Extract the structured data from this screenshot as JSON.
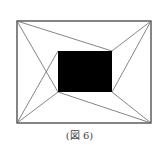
{
  "figure": {
    "caption": "(図 6)",
    "outer_rect": {
      "x": 17,
      "y": 21,
      "w": 134,
      "h": 102
    },
    "inner_rect": {
      "x": 58,
      "y": 51,
      "w": 54,
      "h": 41,
      "fill": "#000000"
    },
    "line_color": "#555555",
    "connectors": [
      {
        "from": "outer-top-left",
        "to": "inner-top-right"
      },
      {
        "from": "outer-top-left",
        "to": "inner-bottom-left"
      },
      {
        "from": "outer-top-right",
        "to": "inner-top-right"
      },
      {
        "from": "outer-top-right",
        "to": "inner-bottom-right"
      },
      {
        "from": "outer-bottom-right",
        "to": "inner-bottom-left"
      },
      {
        "from": "outer-bottom-right",
        "to": "inner-bottom-right"
      },
      {
        "from": "outer-bottom-left",
        "to": "inner-top-left"
      },
      {
        "from": "outer-bottom-left",
        "to": "inner-bottom-left"
      }
    ]
  }
}
